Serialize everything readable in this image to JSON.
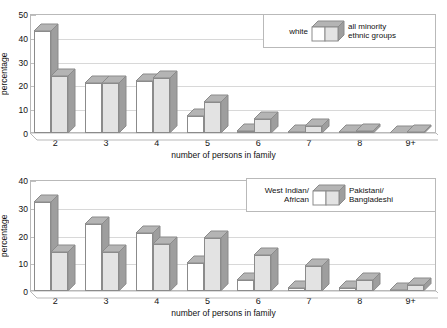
{
  "chart_data": [
    {
      "type": "bar",
      "id": "white-vs-all-minority",
      "title": "",
      "xlabel": "number of persons in family",
      "ylabel": "percentage",
      "categories": [
        "2",
        "3",
        "4",
        "5",
        "6",
        "7",
        "8",
        "9+"
      ],
      "ylim": [
        0,
        50
      ],
      "yticks": [
        0,
        10,
        20,
        30,
        40,
        50
      ],
      "grid": true,
      "legend_position": "top-right",
      "style": "3d-column",
      "series": [
        {
          "name": "white",
          "values": [
            43,
            21,
            22,
            7,
            1,
            0.5,
            0.3,
            0
          ]
        },
        {
          "name": "all minority\nethnic groups",
          "values": [
            24,
            21,
            23,
            13,
            6,
            3,
            1,
            0.6
          ]
        }
      ]
    },
    {
      "type": "bar",
      "id": "west-indian-vs-pakistani",
      "title": "",
      "xlabel": "number of persons in family",
      "ylabel": "percentage",
      "categories": [
        "2",
        "3",
        "4",
        "5",
        "6",
        "7",
        "8",
        "9+"
      ],
      "ylim": [
        0,
        40
      ],
      "yticks": [
        0,
        10,
        20,
        30,
        40
      ],
      "grid": true,
      "legend_position": "top-right",
      "style": "3d-column",
      "series": [
        {
          "name": "West Indian/\nAfrican",
          "values": [
            32,
            24,
            21,
            10,
            4,
            1,
            1,
            0.5
          ]
        },
        {
          "name": "Pakistani/\nBangladeshi",
          "values": [
            14,
            14,
            17,
            19,
            13,
            9,
            4,
            2
          ]
        }
      ]
    }
  ],
  "top_chart": {
    "ylabel": "percentage",
    "xlabel": "number of persons in family",
    "yticks": [
      "0",
      "10",
      "20",
      "30",
      "40",
      "50"
    ],
    "xticks": [
      "2",
      "3",
      "4",
      "5",
      "6",
      "7",
      "8",
      "9+"
    ],
    "legend": {
      "left_label": "white",
      "right_label": "all minority\nethnic groups"
    }
  },
  "bottom_chart": {
    "ylabel": "percentage",
    "xlabel": "number of persons in family",
    "yticks": [
      "0",
      "10",
      "20",
      "30",
      "40"
    ],
    "xticks": [
      "2",
      "3",
      "4",
      "5",
      "6",
      "7",
      "8",
      "9+"
    ],
    "legend": {
      "left_label": "West Indian/\nAfrican",
      "right_label": "Pakistani/\nBangladeshi"
    }
  },
  "colors": {
    "series1_face": "#ffffff",
    "series2_face": "#e3e3e3",
    "top_face": "#b4b4b4",
    "side_face": "#9e9e9e",
    "outline": "#8b8b8b",
    "gridline": "#d8d8d8",
    "frame": "#b9b9b9",
    "text": "#111111",
    "background": "#ffffff"
  }
}
